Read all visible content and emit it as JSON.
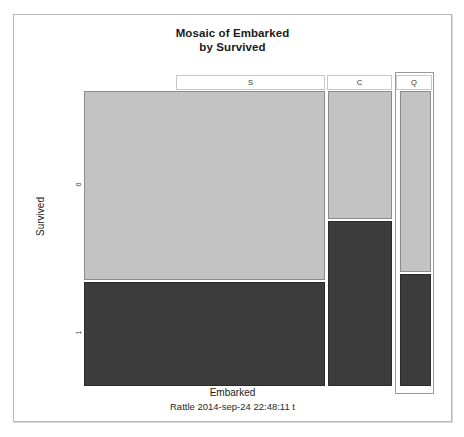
{
  "plot": {
    "title_line1": "Mosaic of Embarked",
    "title_line2": "by Survived",
    "xlabel": "Embarked",
    "ylabel": "Survived",
    "subtitle": "Rattle 2014-sep-24 22:48:11 t"
  },
  "axis": {
    "y_ticks": [
      "0",
      "1"
    ],
    "x_categories": [
      "S",
      "C",
      "Q"
    ]
  },
  "colors": {
    "light_tile": "#c3c3c3",
    "dark_tile": "#3c3c3c",
    "tile_border": "#8c8c8c",
    "frame_border": "#b8b8b8",
    "highlight_border": "#9a9a9a"
  },
  "chart_data": {
    "type": "mosaic",
    "title": "Mosaic of Embarked by Survived",
    "xlabel": "Embarked",
    "ylabel": "Survived",
    "x_categories": [
      "S",
      "C",
      "Q"
    ],
    "y_categories": [
      "0",
      "1"
    ],
    "column_widths_frac": [
      0.718,
      0.191,
      0.091
    ],
    "series": [
      {
        "name": "0",
        "values": [
          0.645,
          0.435,
          0.617
        ],
        "color": "#c3c3c3"
      },
      {
        "name": "1",
        "values": [
          0.355,
          0.565,
          0.383
        ],
        "color": "#3c3c3c"
      }
    ],
    "cells": [
      {
        "x": "S",
        "y": "0",
        "height_frac": 0.645,
        "color": "#c3c3c3"
      },
      {
        "x": "S",
        "y": "1",
        "height_frac": 0.355,
        "color": "#3c3c3c"
      },
      {
        "x": "C",
        "y": "0",
        "height_frac": 0.435,
        "color": "#c3c3c3"
      },
      {
        "x": "C",
        "y": "1",
        "height_frac": 0.565,
        "color": "#3c3c3c"
      },
      {
        "x": "Q",
        "y": "0",
        "height_frac": 0.617,
        "color": "#c3c3c3"
      },
      {
        "x": "Q",
        "y": "1",
        "height_frac": 0.383,
        "color": "#3c3c3c"
      }
    ],
    "highlighted_category": "Q",
    "grid": false,
    "legend": "none"
  }
}
